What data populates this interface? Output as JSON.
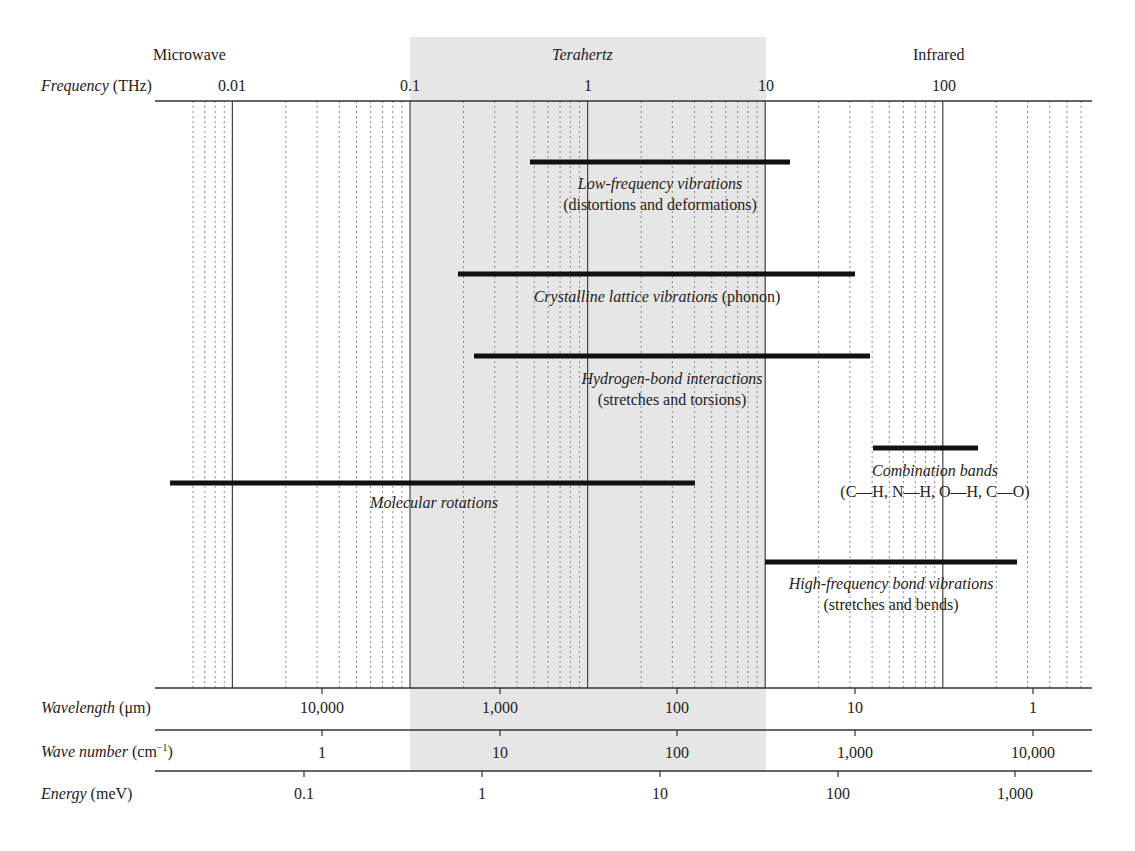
{
  "chart_data": {
    "type": "range-bar",
    "title": "",
    "x_scale": "log",
    "regions": [
      {
        "name": "Microwave",
        "italic": false,
        "label_x": 200
      },
      {
        "name": "Terahertz",
        "italic": true,
        "from_thz": 0.1,
        "to_thz": 10,
        "shaded": true,
        "label_x": 588
      },
      {
        "name": "Infrared",
        "italic": false,
        "label_x": 950
      }
    ],
    "axes": {
      "frequency": {
        "name": "Frequency",
        "unit": "(THz)",
        "ticks": [
          "0.01",
          "0.1",
          "1",
          "10",
          "100"
        ],
        "tick_values_thz": [
          0.01,
          0.1,
          1,
          10,
          100
        ]
      },
      "wavelength": {
        "name": "Wavelength",
        "unit": "(μm)",
        "ticks": [
          "10,000",
          "1,000",
          "100",
          "10",
          "1"
        ],
        "tick_values": [
          10000,
          1000,
          100,
          10,
          1
        ]
      },
      "wave_number": {
        "name": "Wave number",
        "unit": "(cm",
        "unit_sup": "−1",
        "unit_close": ")",
        "ticks": [
          "1",
          "10",
          "100",
          "1,000",
          "10,000"
        ],
        "tick_values": [
          1,
          10,
          100,
          1000,
          10000
        ]
      },
      "energy": {
        "name": "Energy",
        "unit": "(meV)",
        "ticks": [
          "0.1",
          "1",
          "10",
          "100",
          "1,000"
        ],
        "tick_values": [
          0.1,
          1,
          10,
          100,
          1000
        ]
      }
    },
    "xlim_thz": [
      0.0045,
      190.0
    ],
    "grid": "dotted minor lines per decade, solid lines at decades",
    "bands": [
      {
        "name": "Low-frequency vibrations",
        "detail": "(distortions and deformations)",
        "from_thz": 0.47,
        "to_thz": 14,
        "y": 162
      },
      {
        "name": "Crystalline lattice vibrations",
        "detail": "(phonon)",
        "inline_detail": true,
        "from_thz": 0.18,
        "to_thz": 30,
        "y": 274
      },
      {
        "name": "Hydrogen-bond interactions",
        "detail": "(stretches and torsions)",
        "from_thz": 0.22,
        "to_thz": 37,
        "y": 356
      },
      {
        "name": "Combination bands",
        "detail": "(C—H, N—H, O—H, C—O)",
        "from_thz": 38,
        "to_thz": 150,
        "y": 448
      },
      {
        "name": "Molecular rotations",
        "detail": "",
        "from_thz": 0.0045,
        "to_thz": 4.5,
        "y": 483
      },
      {
        "name": "High-frequency bond vibrations",
        "detail": "(stretches and bends)",
        "from_thz": 10,
        "to_thz": 250,
        "y": 562
      }
    ]
  },
  "labels": {
    "region_microwave": "Microwave",
    "region_terahertz": "Terahertz",
    "region_infrared": "Infrared",
    "freq_name": "Frequency",
    "freq_unit": "(THz)",
    "wl_name": "Wavelength",
    "wl_unit": "(μm)",
    "wn_name": "Wave number",
    "wn_unit": "(cm",
    "wn_sup": "−1",
    "wn_close": ")",
    "en_name": "Energy",
    "en_unit": "(meV)",
    "freq_ticks": [
      "0.01",
      "0.1",
      "1",
      "10",
      "100"
    ],
    "wl_ticks": [
      "10,000",
      "1,000",
      "100",
      "10",
      "1"
    ],
    "wn_ticks": [
      "1",
      "10",
      "100",
      "1,000",
      "10,000"
    ],
    "en_ticks": [
      "0.1",
      "1",
      "10",
      "100",
      "1,000"
    ],
    "band_low_title": "Low-frequency vibrations",
    "band_low_detail": "(distortions and deformations)",
    "band_cryst_title": "Crystalline lattice vibrations",
    "band_cryst_detail": "(phonon)",
    "band_hb_title": "Hydrogen-bond interactions",
    "band_hb_detail": "(stretches and torsions)",
    "band_comb_title": "Combination bands",
    "band_comb_detail": "(C—H, N—H, O—H, C—O)",
    "band_mol_title": "Molecular rotations",
    "band_hf_title": "High-frequency bond vibrations",
    "band_hf_detail": "(stretches and bends)"
  },
  "colors": {
    "thz_shade": "#e6e6e6",
    "bar": "#111111",
    "axis": "#333333",
    "grid": "#777777"
  }
}
